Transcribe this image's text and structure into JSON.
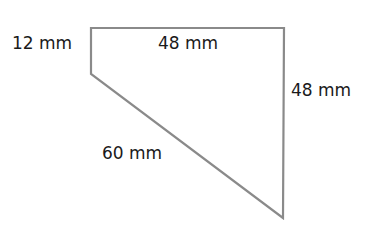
{
  "diagram": {
    "type": "quadrilateral",
    "stroke_color": "#8a8a8a",
    "text_color": "#1a1a1a",
    "vertices": [
      {
        "name": "top-left",
        "x": 91,
        "y": 28
      },
      {
        "name": "top-right",
        "x": 284,
        "y": 28
      },
      {
        "name": "bottom",
        "x": 283,
        "y": 218
      },
      {
        "name": "left-bottom",
        "x": 91,
        "y": 74
      }
    ],
    "labels": {
      "left_side": "12 mm",
      "top_side": "48 mm",
      "right_side": "48 mm",
      "diagonal_side": "60 mm"
    }
  }
}
